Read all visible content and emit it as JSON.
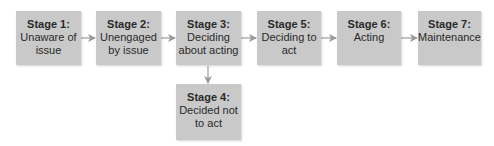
{
  "diagram": {
    "type": "flowchart",
    "colors": {
      "box_fill": "#c9c9c9",
      "text": "#2a2a2a",
      "arrow": "#9a9a9a"
    },
    "stages": [
      {
        "id": "stage-1",
        "title": "Stage 1:",
        "desc": "Unaware of\nissue"
      },
      {
        "id": "stage-2",
        "title": "Stage 2:",
        "desc": "Unengaged\nby issue"
      },
      {
        "id": "stage-3",
        "title": "Stage 3:",
        "desc": "Deciding\nabout acting"
      },
      {
        "id": "stage-5",
        "title": "Stage 5:",
        "desc": "Deciding to\nact"
      },
      {
        "id": "stage-6",
        "title": "Stage 6:",
        "desc": "Acting"
      },
      {
        "id": "stage-7",
        "title": "Stage 7:",
        "desc": "Maintenance"
      },
      {
        "id": "stage-4",
        "title": "Stage 4:",
        "desc": "Decided not\nto act"
      }
    ],
    "edges": [
      {
        "from": "stage-1",
        "to": "stage-2"
      },
      {
        "from": "stage-2",
        "to": "stage-3"
      },
      {
        "from": "stage-3",
        "to": "stage-5"
      },
      {
        "from": "stage-5",
        "to": "stage-6"
      },
      {
        "from": "stage-6",
        "to": "stage-7"
      },
      {
        "from": "stage-3",
        "to": "stage-4"
      }
    ]
  }
}
